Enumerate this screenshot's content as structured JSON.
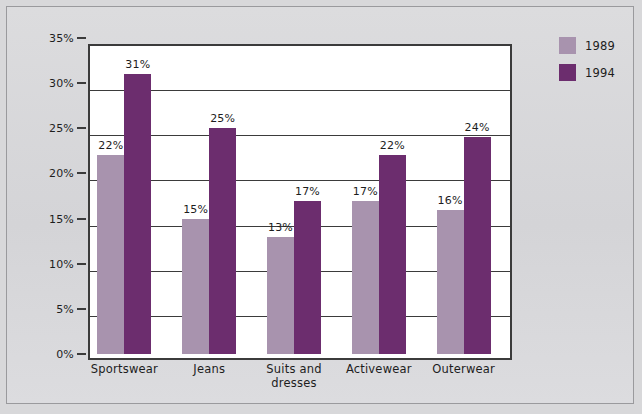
{
  "chart_data": {
    "type": "bar",
    "title": "",
    "xlabel": "",
    "ylabel": "",
    "ylim": [
      0,
      35
    ],
    "ytick_labels": [
      "0%",
      "5%",
      "10%",
      "15%",
      "20%",
      "25%",
      "30%",
      "35%"
    ],
    "ytick_values": [
      0,
      5,
      10,
      15,
      20,
      25,
      30,
      35
    ],
    "grid": true,
    "legend_position": "right",
    "categories": [
      "Sportswear",
      "Jeans",
      "Suits and\ndresses",
      "Activewear",
      "Outerwear"
    ],
    "series": [
      {
        "name": "1989",
        "color": "#a893ae",
        "values": [
          22,
          15,
          13,
          17,
          16
        ],
        "value_labels": [
          "22%",
          "15%",
          "13%",
          "17%",
          "16%"
        ]
      },
      {
        "name": "1994",
        "color": "#6c2d6e",
        "values": [
          31,
          25,
          17,
          22,
          24
        ],
        "value_labels": [
          "31%",
          "25%",
          "17%",
          "22%",
          "24%"
        ]
      }
    ]
  },
  "legend": {
    "items": [
      {
        "label": "1989",
        "color": "#a893ae"
      },
      {
        "label": "1994",
        "color": "#6c2d6e"
      }
    ]
  }
}
